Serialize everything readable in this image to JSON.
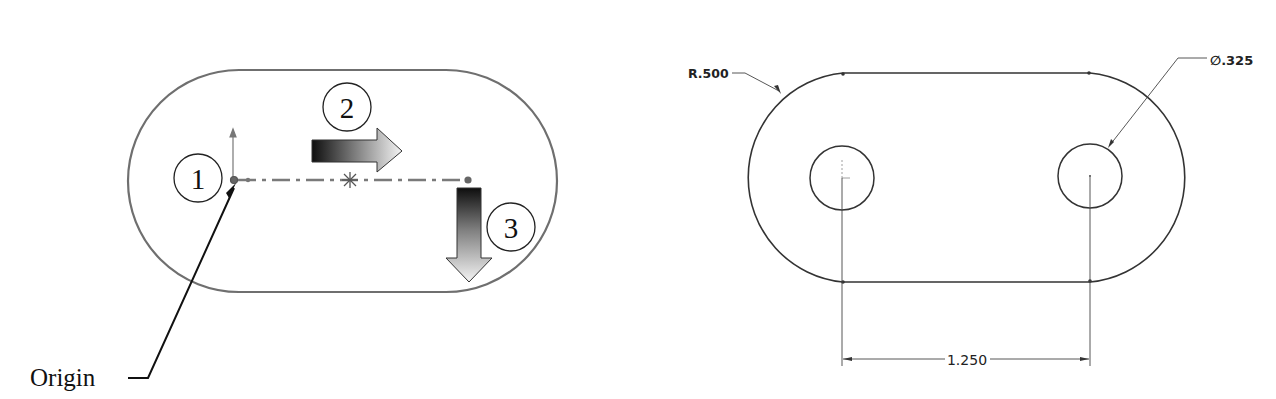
{
  "left_figure": {
    "description": "Sketch steps for slot with origin",
    "steps": [
      {
        "number": "1",
        "meaning": "start at origin"
      },
      {
        "number": "2",
        "meaning": "sketch centerline to the right"
      },
      {
        "number": "3",
        "meaning": "create slot"
      }
    ],
    "origin_label": "Origin",
    "colors": {
      "outline": "#6f6f6f",
      "centerline": "#7a7a7a",
      "arrow_dark": "#111111",
      "arrow_light": "#f2f2f2",
      "text": "#111111"
    }
  },
  "right_figure": {
    "description": "Dimensioned slot drawing with two holes",
    "radius_label": "R.500",
    "hole_diameter_label": "∅.325",
    "center_distance_label": "1.250",
    "colors": {
      "outline": "#333333",
      "dimension": "#444444",
      "text": "#222222"
    }
  }
}
